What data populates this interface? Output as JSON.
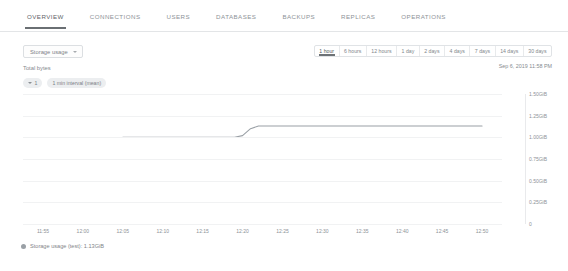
{
  "tabs": [
    {
      "label": "OVERVIEW",
      "active": true
    },
    {
      "label": "CONNECTIONS",
      "active": false
    },
    {
      "label": "USERS",
      "active": false
    },
    {
      "label": "DATABASES",
      "active": false
    },
    {
      "label": "BACKUPS",
      "active": false
    },
    {
      "label": "REPLICAS",
      "active": false
    },
    {
      "label": "OPERATIONS",
      "active": false
    }
  ],
  "controls": {
    "metric_select_label": "Storage usage",
    "metric_select_icon": "chevron-down-icon",
    "subtitle": "Total bytes",
    "filter_chip_label": "1",
    "filter_chip_icon": "filter-funnel-icon",
    "interval_chip_label": "1 min interval (mean)",
    "as_of_timestamp": "Sep 6, 2019 11:58 PM"
  },
  "time_ranges": [
    {
      "label": "1 hour",
      "active": true
    },
    {
      "label": "6 hours",
      "active": false
    },
    {
      "label": "12 hours",
      "active": false
    },
    {
      "label": "1 day",
      "active": false
    },
    {
      "label": "2 days",
      "active": false
    },
    {
      "label": "4 days",
      "active": false
    },
    {
      "label": "7 days",
      "active": false
    },
    {
      "label": "14 days",
      "active": false
    },
    {
      "label": "30 days",
      "active": false
    }
  ],
  "legend": [
    {
      "label": "Storage usage (test): 1.13GiB",
      "color": "#9aa0a6"
    }
  ],
  "chart_data": {
    "type": "line",
    "title": "Storage usage",
    "subtitle": "Total bytes",
    "xlabel": "",
    "ylabel": "",
    "grid": true,
    "legend_position": "bottom-left",
    "line_color": "#9aa0a6",
    "ylim": [
      0,
      1.5
    ],
    "yunit": "GiB",
    "yticks": [
      0,
      0.25,
      0.5,
      0.75,
      1.0,
      1.25,
      1.5
    ],
    "ytick_labels": [
      "0",
      "0.25GiB",
      "0.50GiB",
      "0.75GiB",
      "1.00GiB",
      "1.25GiB",
      "1.50GiB"
    ],
    "xticks": [
      "11:55",
      "12:00",
      "12:05",
      "12:10",
      "12:15",
      "12:20",
      "12:25",
      "12:30",
      "12:35",
      "12:40",
      "12:45",
      "12:50"
    ],
    "series": [
      {
        "name": "Storage usage (test)",
        "x": [
          "12:05",
          "12:08",
          "12:11",
          "12:14",
          "12:17",
          "12:19",
          "12:20",
          "12:21",
          "12:22",
          "12:25",
          "12:30",
          "12:35",
          "12:40",
          "12:45",
          "12:50"
        ],
        "values": [
          1.0,
          1.0,
          1.0,
          1.0,
          1.0,
          1.0,
          1.02,
          1.1,
          1.13,
          1.13,
          1.13,
          1.13,
          1.13,
          1.13,
          1.13
        ]
      }
    ]
  }
}
